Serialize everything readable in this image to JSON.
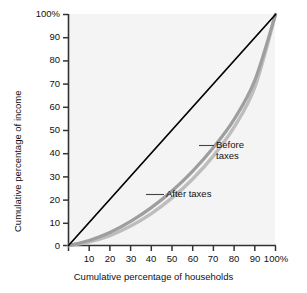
{
  "chart_data": {
    "type": "line",
    "title": "",
    "subtitle": "",
    "xlabel": "Cumulative percentage of households",
    "ylabel": "Cumulative percentage of income",
    "xlim": [
      0,
      100
    ],
    "ylim": [
      0,
      100
    ],
    "grid": false,
    "legend_position": "inline-annotations",
    "x_tick_labels": [
      "0",
      "10",
      "20",
      "30",
      "40",
      "50",
      "60",
      "70",
      "80",
      "90",
      "100%"
    ],
    "x_tick_values": [
      0,
      10,
      20,
      30,
      40,
      50,
      60,
      70,
      80,
      90,
      100
    ],
    "y_tick_labels": [
      "0",
      "10",
      "20",
      "30",
      "40",
      "50",
      "60",
      "70",
      "80",
      "90",
      "100%"
    ],
    "y_tick_values": [
      0,
      10,
      20,
      30,
      40,
      50,
      60,
      70,
      80,
      90,
      100
    ],
    "x": [
      0,
      10,
      20,
      30,
      40,
      50,
      60,
      70,
      80,
      90,
      100
    ],
    "series": [
      {
        "name": "Line of equality",
        "color": "#000000",
        "values": [
          0,
          10,
          20,
          30,
          40,
          50,
          60,
          70,
          80,
          90,
          100
        ]
      },
      {
        "name": "After taxes",
        "color": "#a8a8a8",
        "values": [
          0,
          2.2,
          5.6,
          10.4,
          16.4,
          23.6,
          32.2,
          42.4,
          54.6,
          71.5,
          100
        ]
      },
      {
        "name": "Before taxes",
        "color": "#a8a8a8",
        "values": [
          0,
          1.6,
          4.3,
          8.4,
          13.8,
          20.6,
          28.8,
          38.8,
          51.2,
          68.5,
          100
        ]
      }
    ],
    "annotations": [
      {
        "id": "before",
        "text": "Before\ntaxes",
        "target_x": 72,
        "target_y": 44
      },
      {
        "id": "after",
        "text": "After taxes",
        "target_x": 41,
        "target_y": 21
      }
    ],
    "colors": {
      "equality_line": "#000000",
      "lorenz_curve": "#a8a8a8",
      "plot_background": "#f4f4f4",
      "axis": "#333333",
      "text": "#111111"
    }
  }
}
